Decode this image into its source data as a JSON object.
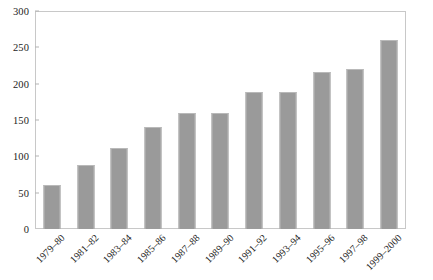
{
  "chart_data": {
    "type": "bar",
    "title": "",
    "subtitle": "",
    "xlabel": "",
    "ylabel": "",
    "ylim": [
      0,
      300
    ],
    "ytick_step": 50,
    "yticks": [
      0,
      50,
      100,
      150,
      200,
      250,
      300
    ],
    "grid": false,
    "legend": false,
    "legend_position": "none",
    "bar_color": "#9a9a9a",
    "bar_edge_color": "#b9b9b9",
    "frame_color": "#c8c8c8",
    "axis_text_color": "#1c1c1c",
    "xtick_rotation": -45,
    "categories": [
      "1979–80",
      "1981–82",
      "1983–84",
      "1985–86",
      "1987–88",
      "1989–90",
      "1991–92",
      "1993–94",
      "1995–96",
      "1997–98",
      "1999–2000"
    ],
    "values": [
      61,
      88,
      112,
      140,
      159,
      159,
      189,
      189,
      216,
      220,
      260
    ]
  },
  "caption": {
    "text": ""
  }
}
